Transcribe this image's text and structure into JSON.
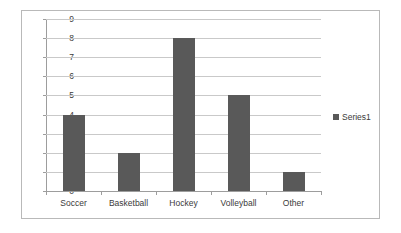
{
  "chart_data": {
    "type": "bar",
    "title": "",
    "subtitle": "",
    "xlabel": "",
    "ylabel": "",
    "categories": [
      "Soccer",
      "Basketball",
      "Hockey",
      "Volleyball",
      "Other"
    ],
    "values": [
      4,
      2,
      8,
      5,
      1
    ],
    "series": [
      {
        "name": "Series1",
        "values": [
          4,
          2,
          8,
          5,
          1
        ]
      }
    ],
    "ylim": [
      0,
      9
    ],
    "y_ticks": [
      0,
      1,
      2,
      3,
      4,
      5,
      6,
      7,
      8,
      9
    ],
    "y_tick_labels": [
      "0",
      "1",
      "2",
      "3",
      "4",
      "5",
      "6",
      "7",
      "8",
      "9"
    ],
    "grid": true,
    "grid_axis": "y",
    "legend": {
      "position": "right",
      "entries": [
        {
          "label": "Series1",
          "marker": "legend-swatch-icon",
          "color": "#595959"
        }
      ]
    },
    "colors": {
      "bar": "#595959",
      "gridline": "#c9c9c9",
      "axis": "#9d9d9d",
      "frame_border": "#b9b9b9",
      "background": "#ffffff",
      "tick_text": "#3a3a3a"
    }
  }
}
